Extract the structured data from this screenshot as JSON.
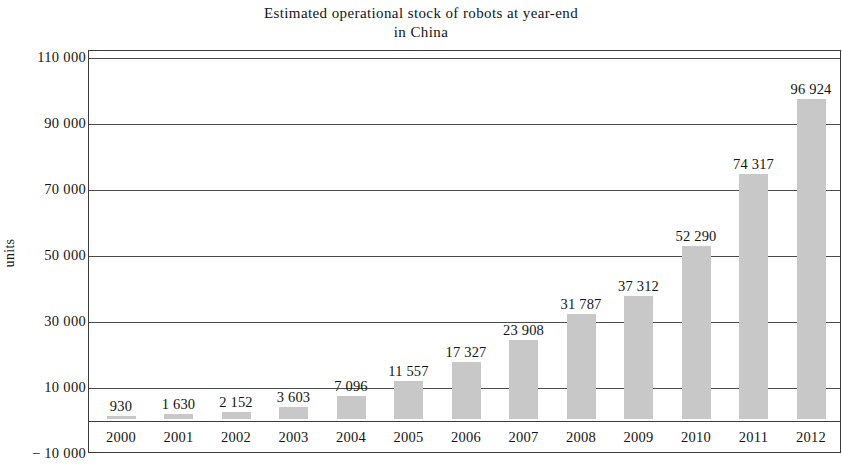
{
  "chart_data": {
    "type": "bar",
    "title": "Estimated operational stock of robots at year-end",
    "title_line2": "in China",
    "xlabel": "",
    "ylabel": "units",
    "categories": [
      "2000",
      "2001",
      "2002",
      "2003",
      "2004",
      "2005",
      "2006",
      "2007",
      "2008",
      "2009",
      "2010",
      "2011",
      "2012"
    ],
    "values": [
      930,
      1630,
      2152,
      3603,
      7096,
      11557,
      17327,
      23908,
      31787,
      37312,
      52290,
      74317,
      96924
    ],
    "value_labels": [
      "930",
      "1 630",
      "2 152",
      "3 603",
      "7 096",
      "11 557",
      "17 327",
      "23 908",
      "31 787",
      "37 312",
      "52 290",
      "74 317",
      "96 924"
    ],
    "ylim": [
      -10000,
      110000
    ],
    "ytick_values": [
      110000,
      90000,
      70000,
      50000,
      30000,
      10000,
      -10000
    ],
    "ytick_labels": [
      "110 000",
      "90 000",
      "70 000",
      "50 000",
      "30 000",
      "10 000",
      "− 10 000"
    ],
    "grid": true,
    "legend": null,
    "bar_color": "#c8c8c8",
    "axis_color": "#3b3b3b"
  }
}
